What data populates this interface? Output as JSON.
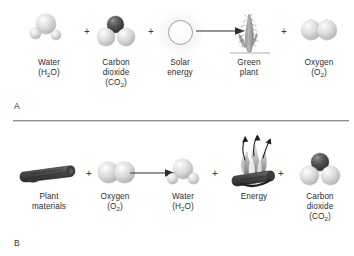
{
  "figure": {
    "divider_color": "#8e8e8e"
  },
  "panel_a": {
    "letter": "A",
    "operators": [
      "+",
      "+",
      "+"
    ],
    "items": [
      {
        "id": "water",
        "icon": "water-molecule",
        "lines": [
          "Water",
          "(H₂O)"
        ],
        "label_line1": "Water",
        "label_line2_pre": "(H",
        "label_line2_sub": "2",
        "label_line2_post": "O)"
      },
      {
        "id": "carbon-dioxide",
        "icon": "carbon-dioxide-molecule",
        "lines": [
          "Carbon",
          "dioxide",
          "(CO₂)"
        ],
        "label_line1": "Carbon",
        "label_line2": "dioxide",
        "label_line3_pre": "(CO",
        "label_line3_sub": "2",
        "label_line3_post": ")"
      },
      {
        "id": "solar-energy",
        "icon": "sun",
        "lines": [
          "Solar",
          "energy"
        ],
        "label_line1": "Solar",
        "label_line2": "energy"
      },
      {
        "id": "green-plant",
        "icon": "plant",
        "lines": [
          "Green",
          "plant"
        ],
        "label_line1": "Green",
        "label_line2": "plant"
      },
      {
        "id": "oxygen",
        "icon": "oxygen-molecule",
        "lines": [
          "Oxygen",
          "(O₂)"
        ],
        "label_line1": "Oxygen",
        "label_line2_pre": "(O",
        "label_line2_sub": "2",
        "label_line2_post": ")"
      }
    ]
  },
  "panel_b": {
    "letter": "B",
    "operators": [
      "+",
      "+",
      "+"
    ],
    "items": [
      {
        "id": "plant-materials",
        "icon": "log",
        "lines": [
          "Plant",
          "materials"
        ],
        "label_line1": "Plant",
        "label_line2": "materials"
      },
      {
        "id": "oxygen",
        "icon": "oxygen-molecule",
        "lines": [
          "Oxygen",
          "(O₂)"
        ],
        "label_line1": "Oxygen",
        "label_line2_pre": "(O",
        "label_line2_sub": "2",
        "label_line2_post": ")"
      },
      {
        "id": "water",
        "icon": "water-molecule",
        "lines": [
          "Water",
          "(H₂O)"
        ],
        "label_line1": "Water",
        "label_line2_pre": "(H",
        "label_line2_sub": "2",
        "label_line2_post": "O)"
      },
      {
        "id": "energy",
        "icon": "campfire",
        "lines": [
          "Energy"
        ],
        "label_line1": "Energy"
      },
      {
        "id": "carbon-dioxide",
        "icon": "carbon-dioxide-molecule",
        "lines": [
          "Carbon",
          "dioxide",
          "(CO₂)"
        ],
        "label_line1": "Carbon",
        "label_line2": "dioxide",
        "label_line3_pre": "(CO",
        "label_line3_sub": "2",
        "label_line3_post": ")"
      }
    ]
  }
}
